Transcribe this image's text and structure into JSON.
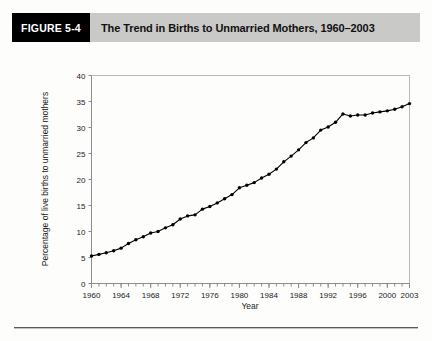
{
  "figure": {
    "tag": "FIGURE 5-4",
    "title": "The Trend in Births to Unmarried Mothers, 1960–2003"
  },
  "colors": {
    "banner_background": "#c9c9c7",
    "tag_background": "#000000",
    "tag_text": "#ffffff",
    "line": "#000000",
    "axis": "#8d8d8d",
    "frame": "#b9b9b9",
    "page_background": "#fdfdfc"
  },
  "chart_data": {
    "type": "line",
    "title": "The Trend in Births to Unmarried Mothers, 1960–2003",
    "xlabel": "Year",
    "ylabel": "Percentage of live births to unmarried mothers",
    "xlim": [
      1960,
      2003
    ],
    "ylim": [
      0,
      40
    ],
    "yticks": [
      0,
      5,
      10,
      15,
      20,
      25,
      30,
      35,
      40
    ],
    "ytick_labels": [
      "0",
      "5",
      "10",
      "15",
      "20",
      "25",
      "30",
      "35",
      "40"
    ],
    "xticks": [
      1960,
      1964,
      1968,
      1972,
      1976,
      1980,
      1984,
      1988,
      1992,
      1996,
      2000,
      2003
    ],
    "xtick_labels": [
      "1960",
      "1964",
      "1968",
      "1972",
      "1976",
      "1980",
      "1984",
      "1988",
      "1992",
      "1996",
      "2000",
      "2003"
    ],
    "x_minor_tick_step": 1,
    "grid": false,
    "legend": false,
    "markers": "filled-circle",
    "x": [
      1960,
      1961,
      1962,
      1963,
      1964,
      1965,
      1966,
      1967,
      1968,
      1969,
      1970,
      1971,
      1972,
      1973,
      1974,
      1975,
      1976,
      1977,
      1978,
      1979,
      1980,
      1981,
      1982,
      1983,
      1984,
      1985,
      1986,
      1987,
      1988,
      1989,
      1990,
      1991,
      1992,
      1993,
      1994,
      1995,
      1996,
      1997,
      1998,
      1999,
      2000,
      2001,
      2002,
      2003
    ],
    "values": [
      5.3,
      5.6,
      5.9,
      6.3,
      6.8,
      7.7,
      8.4,
      9.0,
      9.7,
      10.0,
      10.7,
      11.3,
      12.4,
      13.0,
      13.2,
      14.3,
      14.8,
      15.5,
      16.3,
      17.1,
      18.4,
      18.9,
      19.4,
      20.3,
      21.0,
      22.0,
      23.4,
      24.5,
      25.7,
      27.1,
      28.0,
      29.5,
      30.1,
      31.0,
      32.6,
      32.2,
      32.4,
      32.4,
      32.8,
      33.0,
      33.2,
      33.5,
      34.0,
      34.6
    ]
  }
}
